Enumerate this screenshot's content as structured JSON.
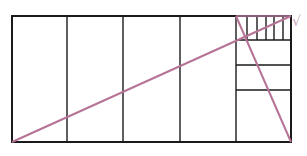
{
  "diagram": {
    "colors": {
      "grid": "#1a1a1a",
      "diagonal": "#b57396",
      "check": "#c9a6b7"
    },
    "outer_rect": {
      "x1": 12,
      "y1": 16,
      "x2": 291,
      "y2": 142
    },
    "large_vertical_lines_x": [
      67,
      123,
      180,
      236
    ],
    "right_column_horizontal_lines_y": [
      40,
      65,
      90
    ],
    "small_vertical_lines_x": [
      247,
      257,
      266,
      274,
      283
    ],
    "diagonals": [
      {
        "name": "long-diagonal",
        "x1": 12,
        "y1": 142,
        "x2": 291,
        "y2": 16
      },
      {
        "name": "steep-diagonal",
        "x1": 236,
        "y1": 16,
        "x2": 291,
        "y2": 142
      }
    ],
    "annotation": {
      "symbol": "√",
      "x": 292,
      "y": 14
    }
  }
}
